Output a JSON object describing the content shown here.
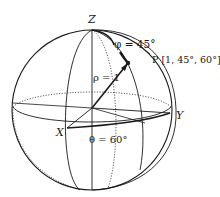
{
  "diagram": {
    "type": "spherical-coordinates",
    "axes": {
      "z_label": "Z",
      "x_label": "X",
      "y_label": "Y"
    },
    "point": {
      "label": "P [1, 45°, 60°]",
      "rho_label": "ρ = 1",
      "phi_label": "φ = 45°",
      "theta_label": "θ = 60°"
    },
    "colors": {
      "stroke": "#1a1a1a",
      "background": "#ffffff"
    }
  }
}
